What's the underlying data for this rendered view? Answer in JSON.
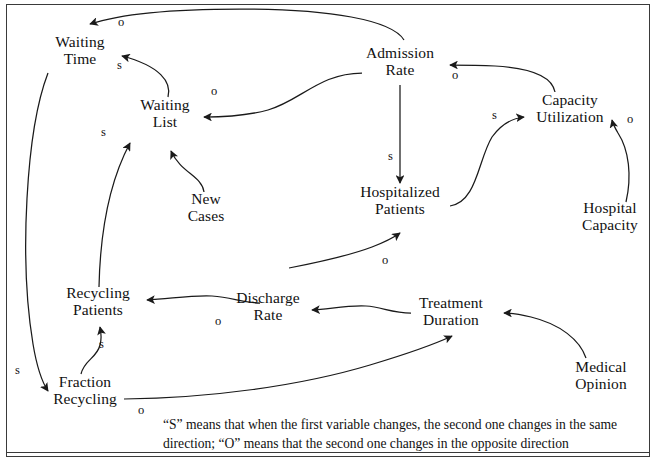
{
  "diagram": {
    "type": "causal-loop-diagram",
    "title_visible": false,
    "nodes": [
      {
        "id": "waiting_time",
        "label": "Waiting\nTime",
        "x": 80,
        "y": 51,
        "w": 64
      },
      {
        "id": "waiting_list",
        "label": "Waiting\nList",
        "x": 165,
        "y": 114,
        "w": 64
      },
      {
        "id": "new_cases",
        "label": "New\nCases",
        "x": 206,
        "y": 208,
        "w": 60
      },
      {
        "id": "admission_rate",
        "label": "Admission\nRate",
        "x": 400,
        "y": 62,
        "w": 80
      },
      {
        "id": "hospitalized_patients",
        "label": "Hospitalized\nPatients",
        "x": 400,
        "y": 201,
        "w": 92
      },
      {
        "id": "capacity_utilization",
        "label": "Capacity\nUtilization",
        "x": 570,
        "y": 109,
        "w": 86
      },
      {
        "id": "hospital_capacity",
        "label": "Hospital\nCapacity",
        "x": 610,
        "y": 217,
        "w": 74
      },
      {
        "id": "recycling_patients",
        "label": "Recycling\nPatients",
        "x": 98,
        "y": 302,
        "w": 78
      },
      {
        "id": "discharge_rate",
        "label": "Discharge\nRate",
        "x": 268,
        "y": 307,
        "w": 76
      },
      {
        "id": "treatment_duration",
        "label": "Treatment\nDuration",
        "x": 451,
        "y": 312,
        "w": 84
      },
      {
        "id": "medical_opinion",
        "label": "Medical\nOpinion",
        "x": 601,
        "y": 376,
        "w": 72
      },
      {
        "id": "fraction_recycling",
        "label": "Fraction\nRecycling",
        "x": 85,
        "y": 391,
        "w": 78
      }
    ],
    "links": [
      {
        "id": "adm_to_wt",
        "from": "admission_rate",
        "to": "waiting_time",
        "polarity": "o",
        "label_x": 118,
        "label_y": 23
      },
      {
        "id": "wl_to_wt",
        "from": "waiting_list",
        "to": "waiting_time",
        "polarity": "s",
        "label_x": 117,
        "label_y": 66
      },
      {
        "id": "adm_to_wl",
        "from": "admission_rate",
        "to": "waiting_list",
        "polarity": "o",
        "label_x": 211,
        "label_y": 92
      },
      {
        "id": "nc_to_wl",
        "from": "new_cases",
        "to": "waiting_list",
        "polarity": "",
        "label_x": 0,
        "label_y": 0
      },
      {
        "id": "rp_to_wl",
        "from": "recycling_patients",
        "to": "waiting_list",
        "polarity": "s",
        "label_x": 101,
        "label_y": 133
      },
      {
        "id": "wt_to_fr",
        "from": "waiting_time",
        "to": "fraction_recycling",
        "polarity": "s",
        "label_x": 15,
        "label_y": 371
      },
      {
        "id": "cu_to_adm",
        "from": "capacity_utilization",
        "to": "admission_rate",
        "polarity": "o",
        "label_x": 452,
        "label_y": 76
      },
      {
        "id": "adm_to_hp",
        "from": "admission_rate",
        "to": "hospitalized_patients",
        "polarity": "s",
        "label_x": 388,
        "label_y": 157
      },
      {
        "id": "hp_to_cu",
        "from": "hospitalized_patients",
        "to": "capacity_utilization",
        "polarity": "s",
        "label_x": 492,
        "label_y": 116
      },
      {
        "id": "hc_to_cu",
        "from": "hospital_capacity",
        "to": "capacity_utilization",
        "polarity": "o",
        "label_x": 627,
        "label_y": 120
      },
      {
        "id": "dr_to_hp",
        "from": "discharge_rate",
        "to": "hospitalized_patients",
        "polarity": "o",
        "label_x": 382,
        "label_y": 261
      },
      {
        "id": "td_to_dr",
        "from": "treatment_duration",
        "to": "discharge_rate",
        "polarity": "",
        "label_x": 0,
        "label_y": 0
      },
      {
        "id": "mo_to_td",
        "from": "medical_opinion",
        "to": "treatment_duration",
        "polarity": "",
        "label_x": 0,
        "label_y": 0
      },
      {
        "id": "fr_to_td",
        "from": "fraction_recycling",
        "to": "treatment_duration",
        "polarity": "o",
        "label_x": 138,
        "label_y": 411
      },
      {
        "id": "dr_to_rp",
        "from": "discharge_rate",
        "to": "recycling_patients",
        "polarity": "o",
        "label_x": 215,
        "label_y": 322
      },
      {
        "id": "fr_to_rp",
        "from": "fraction_recycling",
        "to": "recycling_patients",
        "polarity": "s",
        "label_x": 99,
        "label_y": 345
      }
    ],
    "caption": "“S” means that when the first variable changes, the second one changes in the same direction; “O” means that the second one changes in the opposite direction",
    "colors": {
      "stroke": "#1a1a1a",
      "text": "#111111",
      "border": "#3a3a3a",
      "background": "#ffffff"
    }
  }
}
